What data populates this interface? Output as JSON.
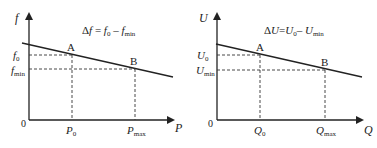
{
  "figure": {
    "left": {
      "y_axis_label": "f",
      "x_axis_label": "P",
      "origin_label": "0",
      "formula": {
        "prefix": "Δ",
        "var": "f",
        "eq": " = ",
        "t1": "f",
        "t1_sub": "0",
        "minus": " – ",
        "t2": "f",
        "t2_sub": "min"
      },
      "y_ticks": [
        {
          "base": "f",
          "sub": "0"
        },
        {
          "base": "f",
          "sub": "min"
        }
      ],
      "x_ticks": [
        {
          "base": "P",
          "sub": "0"
        },
        {
          "base": "P",
          "sub": "max"
        }
      ],
      "points": [
        {
          "label": "A"
        },
        {
          "label": "B"
        }
      ]
    },
    "right": {
      "y_axis_label": "U",
      "x_axis_label": "Q",
      "origin_label": "0",
      "formula": {
        "prefix": "Δ",
        "var": "U",
        "eq": "=",
        "t1": "U",
        "t1_sub": "0",
        "minus": "– ",
        "t2": "U",
        "t2_sub": "min"
      },
      "y_ticks": [
        {
          "base": "U",
          "sub": "0"
        },
        {
          "base": "U",
          "sub": "min"
        }
      ],
      "x_ticks": [
        {
          "base": "Q",
          "sub": "0"
        },
        {
          "base": "Q",
          "sub": "max"
        }
      ],
      "points": [
        {
          "label": "A"
        },
        {
          "label": "B"
        }
      ]
    }
  },
  "colors": {
    "ink": "#222222",
    "background": "#ffffff"
  }
}
